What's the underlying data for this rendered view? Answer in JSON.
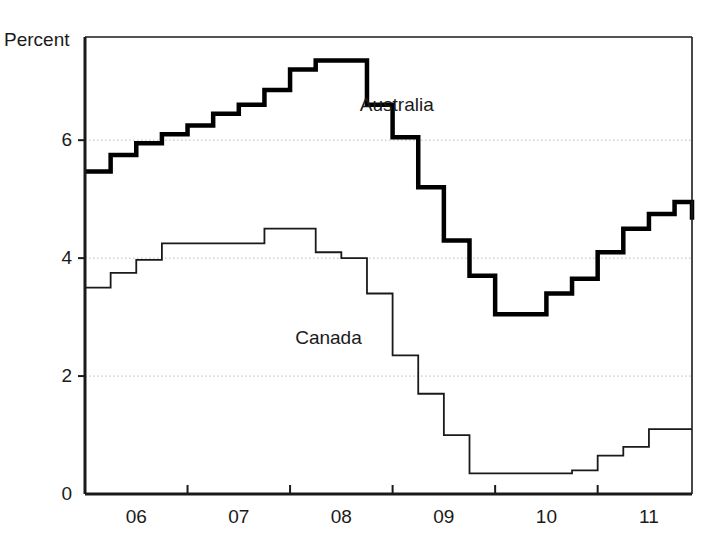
{
  "chart_data": {
    "type": "line",
    "title": "",
    "xlabel": "",
    "ylabel": "Percent",
    "ylim": [
      0,
      7.75
    ],
    "xlim": [
      2005.5,
      2011.42
    ],
    "yticks": [
      0,
      2,
      4,
      6
    ],
    "ytick_labels": [
      "0",
      "2",
      "4",
      "6"
    ],
    "xticks": [
      2006,
      2007,
      2008,
      2009,
      2010,
      2011
    ],
    "xtick_labels": [
      "06",
      "07",
      "08",
      "09",
      "10",
      "11"
    ],
    "grid": "horizontal-dotted",
    "legend_position": "inline-annotations",
    "line_style": "step-post",
    "annotations": [
      {
        "name": "australia-label",
        "text": "Australia",
        "x": 2008.18,
        "y": 6.6
      },
      {
        "name": "canada-label",
        "text": "Canada",
        "x": 2007.55,
        "y": 2.65
      }
    ],
    "series": [
      {
        "name": "Australia",
        "color": "#000000",
        "line_width": 4.5,
        "x": [
          2005.5,
          2005.75,
          2006.0,
          2006.25,
          2006.5,
          2006.75,
          2007.0,
          2007.25,
          2007.5,
          2007.75,
          2008.0,
          2008.25,
          2008.5,
          2008.75,
          2009.0,
          2009.25,
          2009.5,
          2009.75,
          2010.0,
          2010.25,
          2010.5,
          2010.75,
          2011.0,
          2011.25,
          2011.42
        ],
        "values": [
          5.47,
          5.75,
          5.95,
          6.1,
          6.25,
          6.45,
          6.6,
          6.85,
          7.2,
          7.35,
          7.35,
          6.6,
          6.05,
          5.2,
          4.3,
          3.7,
          3.05,
          3.05,
          3.4,
          3.65,
          4.1,
          4.5,
          4.75,
          4.95,
          4.95
        ]
      },
      {
        "name": "Canada",
        "color": "#1a1a1a",
        "line_width": 1.8,
        "x": [
          2005.5,
          2005.75,
          2006.0,
          2006.25,
          2006.5,
          2006.75,
          2007.0,
          2007.25,
          2007.5,
          2007.75,
          2008.0,
          2008.25,
          2008.5,
          2008.75,
          2009.0,
          2009.25,
          2009.5,
          2009.75,
          2010.0,
          2010.25,
          2010.5,
          2010.75,
          2011.0,
          2011.25,
          2011.42
        ],
        "values": [
          3.5,
          3.75,
          3.97,
          4.25,
          4.25,
          4.25,
          4.25,
          4.5,
          4.5,
          4.1,
          4.0,
          3.4,
          2.35,
          1.7,
          1.0,
          0.35,
          0.35,
          0.35,
          0.35,
          0.4,
          0.65,
          0.8,
          1.1,
          1.1,
          1.1
        ]
      }
    ],
    "series_end_values": [
      {
        "name": "Australia",
        "final_step": 4.65
      },
      {
        "name": "Canada",
        "final_step": 1.1
      }
    ]
  },
  "axes": {
    "frame_color": "#1a1a1a",
    "grid_color": "#b8b8b8",
    "background": "#ffffff"
  }
}
